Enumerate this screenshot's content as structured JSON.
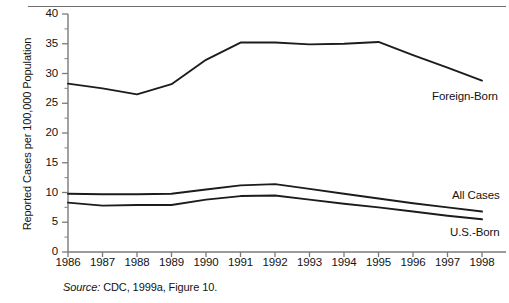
{
  "chart_data": {
    "type": "line",
    "title": "",
    "xlabel": "",
    "ylabel": "Reported Cases per 100,000 Population",
    "x": [
      1986,
      1987,
      1988,
      1989,
      1990,
      1991,
      1992,
      1993,
      1994,
      1995,
      1996,
      1997,
      1998
    ],
    "categories": [
      "1986",
      "1987",
      "1988",
      "1989",
      "1990",
      "1991",
      "1992",
      "1993",
      "1994",
      "1995",
      "1996",
      "1997",
      "1998"
    ],
    "series": [
      {
        "name": "Foreign-Born",
        "values": [
          28.3,
          27.5,
          26.5,
          28.2,
          32.3,
          35.2,
          35.2,
          34.9,
          35.0,
          35.3,
          33.1,
          31.0,
          28.8
        ]
      },
      {
        "name": "All Cases",
        "values": [
          9.8,
          9.7,
          9.7,
          9.8,
          10.5,
          11.2,
          11.4,
          10.6,
          9.8,
          9.0,
          8.2,
          7.5,
          6.8
        ]
      },
      {
        "name": "U.S.-Born",
        "values": [
          8.3,
          7.8,
          7.9,
          7.9,
          8.8,
          9.4,
          9.5,
          8.8,
          8.1,
          7.5,
          6.8,
          6.1,
          5.5
        ]
      }
    ],
    "xlim": [
      1986,
      1998
    ],
    "ylim": [
      0,
      40
    ],
    "ytick_values": [
      0,
      5,
      10,
      15,
      20,
      25,
      30,
      35,
      40
    ],
    "ytick_labels": [
      "0",
      "5",
      "10",
      "15",
      "20",
      "25",
      "30",
      "35",
      "40"
    ],
    "yminor_step": 2.5,
    "grid": false,
    "legend_position": "inline-right",
    "line_color": "#1c1c1c",
    "axis_color": "#7a7a7a"
  },
  "annotations": {
    "series_labels": [
      {
        "text": "Foreign-Born",
        "left": 432,
        "top": 90
      },
      {
        "text": "All Cases",
        "left": 452,
        "top": 189
      },
      {
        "text": "U.S.-Born",
        "left": 450,
        "top": 226
      }
    ]
  },
  "source": {
    "prefix": "Source:",
    "text": " CDC, 1999a, Figure 10."
  }
}
